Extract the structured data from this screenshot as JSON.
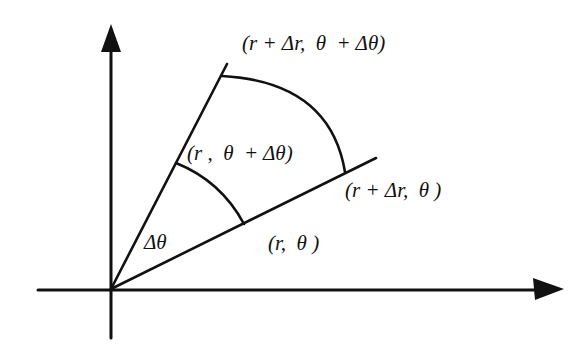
{
  "diagram": {
    "colors": {
      "ink": "#111111",
      "background": "#ffffff"
    },
    "axes": {
      "x_axis": {
        "arrow": "right"
      },
      "y_axis": {
        "arrow": "up"
      }
    },
    "labels": {
      "outer_corner": "(r + Δr,  θ  + Δθ)",
      "inner_corner_top": "(r ,  θ  + Δθ)",
      "outer_corner_bottom": "(r + Δr,  θ )",
      "inner_corner_bottom": "(r,  θ )",
      "angle": "Δθ"
    }
  }
}
